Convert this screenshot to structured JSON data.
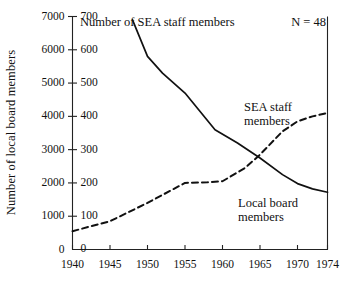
{
  "chart_data": {
    "type": "line",
    "title": "Number of SEA staff members",
    "annotation_n": "N = 48",
    "xlabel": "",
    "ylabel_left": "Number of local board members",
    "grid": false,
    "legend_position": "inline-annotations",
    "x": [
      1940,
      1945,
      1950,
      1955,
      1960,
      1965,
      1970,
      1974
    ],
    "xlim": [
      1940,
      1974
    ],
    "xticks": [
      "1940",
      "1945",
      "1950",
      "1955",
      "1960",
      "1965",
      "1970",
      "1974"
    ],
    "left_axis": {
      "label": "Number of local board members",
      "ylim": [
        0,
        7000
      ],
      "yticks": [
        "0",
        "1000",
        "2000",
        "3000",
        "4000",
        "5000",
        "6000",
        "7000"
      ],
      "ytick_values": [
        0,
        1000,
        2000,
        3000,
        4000,
        5000,
        6000,
        7000
      ]
    },
    "right_axis": {
      "label": "Number of SEA staff members",
      "ylim": [
        0,
        700
      ],
      "yticks": [
        "0",
        "100",
        "200",
        "300",
        "400",
        "500",
        "600",
        "700"
      ],
      "ytick_values": [
        0,
        100,
        200,
        300,
        400,
        500,
        600,
        700
      ]
    },
    "series": [
      {
        "name": "Local board members",
        "style": "solid",
        "axis": "left",
        "color": "#111111",
        "x": [
          1948,
          1950,
          1952,
          1955,
          1959,
          1962,
          1965,
          1968,
          1970,
          1972,
          1974
        ],
        "values": [
          6900,
          5800,
          5300,
          4700,
          3600,
          3200,
          2750,
          2250,
          1980,
          1820,
          1720
        ]
      },
      {
        "name": "SEA staff members",
        "style": "dashed",
        "axis": "right",
        "color": "#111111",
        "x": [
          1940,
          1945,
          1950,
          1955,
          1958,
          1960,
          1963,
          1965,
          1968,
          1970,
          1972,
          1974
        ],
        "values": [
          55,
          85,
          140,
          200,
          202,
          205,
          245,
          285,
          355,
          385,
          400,
          410
        ]
      }
    ]
  },
  "annotations": {
    "sea_staff_line1": "SEA staff",
    "sea_staff_line2": "members",
    "local_board_line1": "Local board",
    "local_board_line2": "members"
  }
}
